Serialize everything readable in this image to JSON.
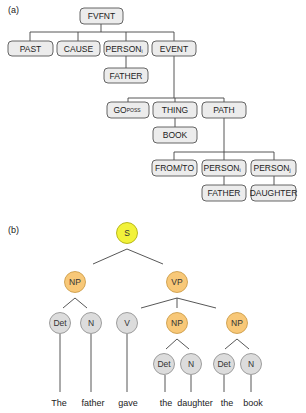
{
  "panel_a": {
    "label": "(a)",
    "nodes": {
      "root": "FVFNT",
      "past": "PAST",
      "cause": "CAUSE",
      "person_i": "PERSON",
      "person_i_sub": "i",
      "event": "EVENT",
      "father_1": "FATHER",
      "go": "GO",
      "go_sub": "POSS",
      "thing": "THING",
      "path": "PATH",
      "book": "BOOK",
      "from_to": "FROM/TO",
      "person_i2": "PERSON",
      "person_i2_sub": "i",
      "person_j": "PERSON",
      "person_j_sub": "j",
      "father_2": "FATHER",
      "daughter": "DAUGHTER"
    }
  },
  "panel_b": {
    "label": "(b)",
    "nodes": {
      "s": "S",
      "np1": "NP",
      "vp": "VP",
      "det1": "Det",
      "n1": "N",
      "v": "V",
      "np2": "NP",
      "np3": "NP",
      "det2": "Det",
      "n2": "N",
      "det3": "Det",
      "n3": "N"
    },
    "words": [
      "The",
      "father",
      "gave",
      "the",
      "daughter",
      "the",
      "book"
    ],
    "colors": {
      "sentence": "#f2f23a",
      "phrase": "#f8c878",
      "terminal": "#dcdcdc"
    }
  }
}
